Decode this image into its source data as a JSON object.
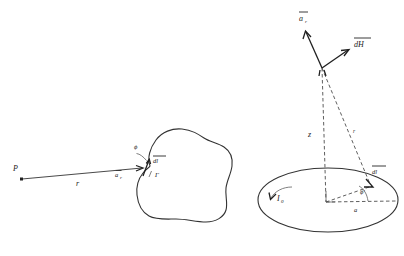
{
  "figure": {
    "background_color": "#ffffff",
    "ink_color": "#1a1a1a",
    "panels": [
      {
        "id": "left",
        "name": "arbitrary-current-contour",
        "description": "Point P, distance vector r to a current element dl on an arbitrary closed contour Gamma",
        "labels": {
          "point_p": "P",
          "distance_r": "r",
          "unit_vector_ar": "a",
          "unit_vector_ar_sub": "r",
          "angle_phi": "ϕ",
          "element_dl": "dl",
          "contour_gamma": "Γ"
        }
      },
      {
        "id": "right",
        "name": "circular-current-loop",
        "description": "Circular loop of radius a carrying current I0, field point on the z axis, vectors a_r and dH",
        "labels": {
          "unit_vector_ar": "a",
          "unit_vector_ar_sub": "r",
          "field_dh": "dH",
          "axis_z": "z",
          "distance_r": "r",
          "element_dl": "dl",
          "angle_phi": "ϕ′",
          "radius_a": "a",
          "current_i0": "I",
          "current_i0_sub": "0"
        }
      }
    ]
  }
}
